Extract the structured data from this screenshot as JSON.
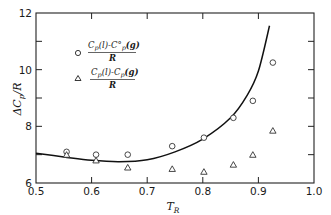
{
  "chart_data": {
    "type": "scatter",
    "title": "",
    "xlabel": "T_R",
    "ylabel": "ΔC_p / R",
    "xlim": [
      0.5,
      1.0
    ],
    "ylim": [
      6,
      12
    ],
    "x_ticks": [
      0.5,
      0.6,
      0.7,
      0.8,
      0.9,
      1.0
    ],
    "x_tick_labels": [
      "0.5",
      "0.6",
      "0.7",
      "0.8",
      "0.9",
      "1.0"
    ],
    "y_ticks": [
      6,
      8,
      10,
      12
    ],
    "y_tick_labels": [
      "6",
      "8",
      "10",
      "12"
    ],
    "y_minor_ticks": [
      7,
      9,
      11
    ],
    "grid": false,
    "legend_position": "upper-left",
    "series": [
      {
        "name": "[C_p(l) − C°_p(g)] / R",
        "marker": "circle",
        "x": [
          0.555,
          0.608,
          0.665,
          0.745,
          0.802,
          0.855,
          0.89,
          0.926
        ],
        "y": [
          7.1,
          7.0,
          7.0,
          7.3,
          7.6,
          8.3,
          8.9,
          10.25
        ]
      },
      {
        "name": "[C_p(l) − C_p(g)] / R",
        "marker": "triangle",
        "x": [
          0.555,
          0.608,
          0.665,
          0.745,
          0.802,
          0.855,
          0.89,
          0.926
        ],
        "y": [
          7.0,
          6.8,
          6.55,
          6.5,
          6.4,
          6.65,
          7.0,
          7.85
        ]
      },
      {
        "name": "correlation curve",
        "marker": "line",
        "x": [
          0.5,
          0.55,
          0.6,
          0.65,
          0.7,
          0.75,
          0.8,
          0.85,
          0.88,
          0.9,
          0.92
        ],
        "y": [
          7.05,
          6.92,
          6.8,
          6.75,
          6.82,
          7.1,
          7.55,
          8.3,
          9.1,
          9.95,
          11.55
        ]
      }
    ]
  },
  "legend": {
    "items": [
      {
        "marker": "circle",
        "numerator": "C",
        "num_sub": "p",
        "num_rest": "(l)-C°",
        "num_sub2": "p",
        "num_tail": "(g)",
        "denominator": "R"
      },
      {
        "marker": "triangle",
        "numerator": "C",
        "num_sub": "p",
        "num_rest": "(l)-C",
        "num_sub2": "p",
        "num_tail": "(g)",
        "denominator": "R"
      }
    ]
  },
  "axes": {
    "x_label_main": "T",
    "x_label_sub": "R",
    "y_label_main": "ΔC",
    "y_label_sub": "p",
    "y_label_tail": "/R"
  }
}
